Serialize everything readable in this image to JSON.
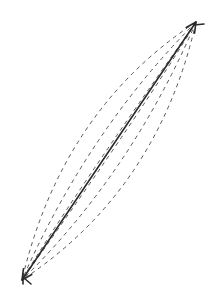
{
  "diagram": {
    "type": "line-with-dashed-alternatives",
    "background": "#ffffff",
    "stroke_color": "#2a2a2a",
    "dashed_color": "#555555",
    "endpoints": {
      "top": {
        "x": 196,
        "y": 22,
        "marker": "arrowhead"
      },
      "bottom": {
        "x": 22,
        "y": 280,
        "marker": "arrowhead"
      }
    },
    "main_line": {
      "style": "solid",
      "width": 1.6
    },
    "dashed_curves": [
      {
        "name": "left-outer",
        "cx": 62,
        "cy": 110
      },
      {
        "name": "left-inner",
        "cx": 88,
        "cy": 130
      },
      {
        "name": "right-inner",
        "cx": 132,
        "cy": 172
      },
      {
        "name": "right-outer",
        "cx": 158,
        "cy": 190
      },
      {
        "name": "cross-a",
        "cx": 150,
        "cy": 100
      },
      {
        "name": "cross-b",
        "cx": 70,
        "cy": 200
      }
    ]
  }
}
